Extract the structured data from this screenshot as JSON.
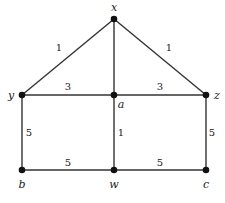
{
  "graph": {
    "nodes": [
      {
        "id": "x",
        "label": "x",
        "cx": 114,
        "cy": 19,
        "lx": 114,
        "ly": 11,
        "anchor": "middle"
      },
      {
        "id": "y",
        "label": "y",
        "cx": 22,
        "cy": 95,
        "lx": 11,
        "ly": 99,
        "anchor": "middle"
      },
      {
        "id": "a",
        "label": "a",
        "cx": 114,
        "cy": 95,
        "lx": 121,
        "ly": 108,
        "anchor": "middle"
      },
      {
        "id": "z",
        "label": "z",
        "cx": 206,
        "cy": 95,
        "lx": 217,
        "ly": 99,
        "anchor": "middle"
      },
      {
        "id": "b",
        "label": "b",
        "cx": 22,
        "cy": 170,
        "lx": 22,
        "ly": 188,
        "anchor": "middle"
      },
      {
        "id": "w",
        "label": "w",
        "cx": 114,
        "cy": 170,
        "lx": 114,
        "ly": 188,
        "anchor": "middle"
      },
      {
        "id": "c",
        "label": "c",
        "cx": 206,
        "cy": 170,
        "lx": 206,
        "ly": 188,
        "anchor": "middle"
      }
    ],
    "edges": [
      {
        "from": "x",
        "to": "y",
        "weight": "1",
        "wx": 59,
        "wy": 51
      },
      {
        "from": "x",
        "to": "z",
        "weight": "1",
        "wx": 169,
        "wy": 51
      },
      {
        "from": "x",
        "to": "a",
        "weight": "",
        "wx": 0,
        "wy": 0
      },
      {
        "from": "y",
        "to": "a",
        "weight": "3",
        "wx": 68,
        "wy": 90
      },
      {
        "from": "a",
        "to": "z",
        "weight": "3",
        "wx": 160,
        "wy": 90
      },
      {
        "from": "y",
        "to": "b",
        "weight": "5",
        "wx": 29,
        "wy": 136
      },
      {
        "from": "a",
        "to": "w",
        "weight": "1",
        "wx": 121,
        "wy": 136
      },
      {
        "from": "z",
        "to": "c",
        "weight": "5",
        "wx": 212,
        "wy": 136
      },
      {
        "from": "b",
        "to": "w",
        "weight": "5",
        "wx": 68,
        "wy": 166
      },
      {
        "from": "w",
        "to": "c",
        "weight": "5",
        "wx": 160,
        "wy": 166
      }
    ]
  }
}
